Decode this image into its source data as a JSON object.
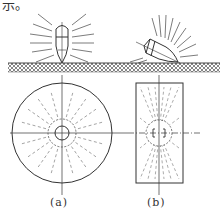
{
  "note_text": "示。",
  "captions": {
    "a": "(a)",
    "b": "(b)"
  },
  "colors": {
    "line": "#333333",
    "dashed": "#888888",
    "hatch": "#555555"
  },
  "figure": {
    "panel_a": {
      "description": "Vertical probe on surface; circular radiation pattern in plan view",
      "probe_angle_deg": 90,
      "plan_shape": "circle"
    },
    "panel_b": {
      "description": "Tilted probe on surface; elongated rectangular radiation pattern in plan view",
      "probe_angle_deg": 30,
      "plan_shape": "rectangle"
    }
  }
}
